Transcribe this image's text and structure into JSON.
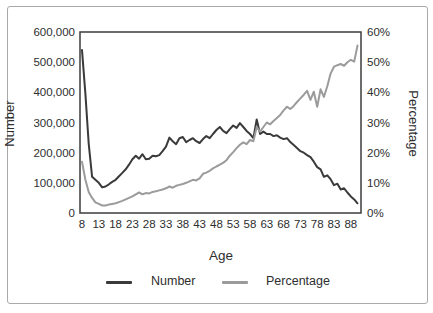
{
  "chart_data": {
    "type": "line",
    "title": "",
    "xlabel": "Age",
    "ylabel_left": "Number",
    "ylabel_right": "Percentage",
    "x_ticks": [
      "8",
      "13",
      "18",
      "23",
      "28",
      "33",
      "38",
      "43",
      "48",
      "53",
      "58",
      "63",
      "68",
      "73",
      "78",
      "83",
      "88"
    ],
    "y_left_ticks": [
      "600,000",
      "500,000",
      "400,000",
      "300,000",
      "200,000",
      "100,000",
      "0"
    ],
    "y_right_ticks": [
      "60%",
      "50%",
      "40%",
      "30%",
      "20%",
      "10%",
      "0%"
    ],
    "x_range": [
      8,
      90
    ],
    "y_left_range": [
      0,
      600000
    ],
    "y_right_range": [
      0,
      60
    ],
    "grid": false,
    "legend_position": "bottom",
    "ages": [
      8,
      9,
      10,
      11,
      12,
      13,
      14,
      15,
      16,
      17,
      18,
      19,
      20,
      21,
      22,
      23,
      24,
      25,
      26,
      27,
      28,
      29,
      30,
      31,
      32,
      33,
      34,
      35,
      36,
      37,
      38,
      39,
      40,
      41,
      42,
      43,
      44,
      45,
      46,
      47,
      48,
      49,
      50,
      51,
      52,
      53,
      54,
      55,
      56,
      57,
      58,
      59,
      60,
      61,
      62,
      63,
      64,
      65,
      66,
      67,
      68,
      69,
      70,
      71,
      72,
      73,
      74,
      75,
      76,
      77,
      78,
      79,
      80,
      81,
      82,
      83,
      84,
      85,
      86,
      87,
      88,
      89,
      90
    ],
    "series": [
      {
        "name": "Number",
        "axis": "left",
        "color": "#3a3a3a",
        "values": [
          540000,
          395000,
          230000,
          120000,
          110000,
          100000,
          85000,
          88000,
          95000,
          103000,
          110000,
          122000,
          133000,
          145000,
          160000,
          178000,
          190000,
          180000,
          195000,
          178000,
          180000,
          190000,
          188000,
          192000,
          205000,
          220000,
          250000,
          238000,
          228000,
          248000,
          252000,
          235000,
          242000,
          248000,
          238000,
          232000,
          245000,
          255000,
          248000,
          262000,
          275000,
          285000,
          272000,
          265000,
          278000,
          290000,
          282000,
          298000,
          285000,
          272000,
          262000,
          248000,
          310000,
          262000,
          270000,
          262000,
          262000,
          255000,
          258000,
          250000,
          245000,
          248000,
          235000,
          225000,
          215000,
          205000,
          200000,
          192000,
          185000,
          170000,
          152000,
          145000,
          120000,
          125000,
          112000,
          92000,
          97000,
          78000,
          82000,
          68000,
          55000,
          45000,
          32000
        ]
      },
      {
        "name": "Percentage",
        "axis": "right",
        "color": "#9b9b9b",
        "values": [
          17,
          11,
          7,
          5,
          3.5,
          3,
          2.5,
          2.5,
          2.8,
          3,
          3.2,
          3.6,
          4,
          4.5,
          5,
          5.5,
          6.2,
          6.8,
          6.2,
          6.6,
          6.5,
          7,
          7.2,
          7.5,
          7.8,
          8.2,
          8.8,
          8.4,
          9,
          9.3,
          9.6,
          10,
          10.5,
          11,
          10.8,
          11.5,
          13,
          13.4,
          14,
          14.8,
          15.4,
          16,
          16.6,
          17.5,
          19,
          20.2,
          21.5,
          22.6,
          23.4,
          22.8,
          24.2,
          23.8,
          28.5,
          27,
          28.5,
          30,
          29.4,
          30.5,
          31.5,
          32.5,
          34,
          35.2,
          34.5,
          35.5,
          36.8,
          38,
          39.2,
          40.5,
          37.5,
          40.2,
          35.2,
          41,
          38.5,
          42,
          46.2,
          48.5,
          49,
          49.4,
          48.8,
          50,
          50.8,
          50.2,
          55.5
        ]
      }
    ],
    "legend": [
      {
        "label": "Number",
        "color": "#3a3a3a"
      },
      {
        "label": "Percentage",
        "color": "#9b9b9b"
      }
    ]
  },
  "colors": {
    "frame_border": "#a9a9a9",
    "plot_border": "#3c3c3c",
    "text": "#2e2e2e",
    "background": "#ffffff"
  }
}
